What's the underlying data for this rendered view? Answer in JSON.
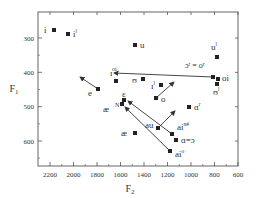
{
  "chart_data": {
    "type": "scatter",
    "title": "",
    "xlabel": "F2",
    "ylabel": "F1",
    "x_reversed": true,
    "y_reversed": true,
    "xlim": [
      2300,
      600
    ],
    "ylim": [
      225,
      670
    ],
    "x_ticks": [
      2200,
      2000,
      1800,
      1600,
      1400,
      1200,
      1000,
      800,
      600
    ],
    "y_ticks": [
      300,
      400,
      500,
      600
    ],
    "grid": false,
    "legend": null,
    "points": [
      {
        "label": "i",
        "sup": "",
        "F2": 2160,
        "F1": 290,
        "px": 54,
        "py": 30,
        "lx": 44,
        "ly": 33
      },
      {
        "label": "i",
        "sup": "l",
        "F2": 2040,
        "F1": 290,
        "px": 68,
        "py": 34,
        "lx": 73,
        "ly": 37
      },
      {
        "label": "e",
        "sup": "",
        "F2": 1760,
        "F1": 450,
        "px": 98,
        "py": 89,
        "lx": 88,
        "ly": 96,
        "arrow_to": [
          80,
          77
        ]
      },
      {
        "label": "ɪ",
        "sup": "",
        "F2": 1610,
        "F1": 425,
        "px": 116,
        "py": 81,
        "lx": 110,
        "ly": 76
      },
      {
        "label": "u",
        "sup": "",
        "F2": 1460,
        "F1": 320,
        "px": 135,
        "py": 45,
        "lx": 140,
        "ly": 48
      },
      {
        "label": "ʊ",
        "sup": "",
        "F2": 1390,
        "F1": 425,
        "px": 143,
        "py": 79,
        "lx": 132,
        "ly": 83
      },
      {
        "label": "ɪ",
        "sup": "l",
        "F2": 1240,
        "F1": 440,
        "px": 161,
        "py": 85,
        "lx": 151,
        "ly": 89
      },
      {
        "label": "o",
        "sup": "",
        "F2": 1280,
        "F1": 475,
        "px": 156,
        "py": 98,
        "lx": 161,
        "ly": 102,
        "arrow_to": [
          174,
          82
        ]
      },
      {
        "label": "ε",
        "sup": "",
        "F2": 1590,
        "F1": 480,
        "px": 124,
        "py": 100,
        "lx": 122,
        "ly": 97
      },
      {
        "label": "æ",
        "sup": "N",
        "F2": 1600,
        "F1": 490,
        "px": 122,
        "py": 104,
        "lx": 103,
        "ly": 112
      },
      {
        "label": "æ",
        "sup": "",
        "F2": 1470,
        "F1": 580,
        "px": 135,
        "py": 133,
        "lx": 121,
        "ly": 136
      },
      {
        "label": "au",
        "sup": "",
        "F2": 1270,
        "F1": 560,
        "px": 158,
        "py": 128,
        "lx": 145,
        "ly": 128,
        "arrow_to": [
          175,
          111
        ]
      },
      {
        "label": "ai",
        "sup": "n#",
        "F2": 1150,
        "F1": 580,
        "px": 172,
        "py": 134,
        "lx": 177,
        "ly": 130
      },
      {
        "label": "ɑ=ɔ",
        "sup": "",
        "F2": 1110,
        "F1": 590,
        "px": 176,
        "py": 140,
        "lx": 181,
        "ly": 143
      },
      {
        "label": "ai",
        "sup": "o",
        "F2": 1180,
        "F1": 630,
        "px": 170,
        "py": 151,
        "lx": 175,
        "ly": 157
      },
      {
        "label": "ɑ",
        "sup": "r",
        "F2": 1000,
        "F1": 505,
        "px": 189,
        "py": 107,
        "lx": 194,
        "ly": 110
      },
      {
        "label": "u",
        "sup": "l",
        "F2": 780,
        "F1": 355,
        "px": 217,
        "py": 57,
        "lx": 211,
        "ly": 50
      },
      {
        "label": "ɔ",
        "sup": "r",
        "F2": 810,
        "F1": 410,
        "px": 213,
        "py": 77,
        "lx": 185,
        "ly": 68
      },
      {
        "label": "oi",
        "sup": "",
        "F2": 790,
        "F1": 415,
        "px": 218,
        "py": 79,
        "lx": 222,
        "ly": 81
      },
      {
        "label": "ʊ",
        "sup": "l",
        "F2": 790,
        "F1": 430,
        "px": 217,
        "py": 84,
        "lx": 213,
        "ly": 95
      }
    ],
    "annotations": [
      {
        "text": "ɔʳ = oʳ",
        "x": 185,
        "y": 68
      },
      {
        "text": "oi",
        "x": 112,
        "y": 71,
        "arrow_from": [
          213,
          77
        ],
        "arrow_to": [
          114,
          73
        ]
      },
      {
        "text": "N",
        "x": 115,
        "y": 107
      }
    ],
    "diagonal_arrows": [
      {
        "from": [
          170,
          151
        ],
        "to": [
          125,
          107
        ]
      },
      {
        "from": [
          172,
          134
        ],
        "to": [
          128,
          101
        ]
      }
    ]
  },
  "axes": {
    "x_label": "F",
    "x_sub": "2",
    "y_label": "F",
    "y_sub": "1",
    "x_ticks": [
      "2200",
      "2000",
      "1800",
      "1600",
      "1400",
      "1200",
      "1000",
      "800",
      "600"
    ],
    "y_ticks": [
      "300",
      "400",
      "500",
      "600"
    ]
  }
}
